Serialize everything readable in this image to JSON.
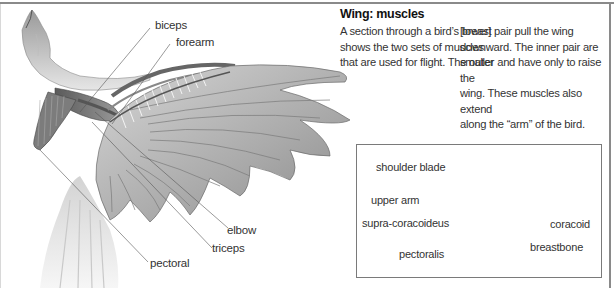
{
  "article": {
    "title": "Wing: muscles",
    "column1": [
      "A section through a bird’s breast",
      "shows the two sets of muscles",
      "that are used for flight. The outer"
    ],
    "column2": [
      "[lower] pair pull the wing",
      "downward. The inner pair are",
      "smaller and have only to raise the",
      "wing. These muscles also extend",
      "along the “arm” of the bird."
    ]
  },
  "main_illustration": {
    "subject": "bird-wing-muscles-illustration",
    "labels": {
      "biceps": "biceps",
      "forearm": "forearm",
      "elbow": "elbow",
      "triceps": "triceps",
      "pectoral": "pectoral"
    }
  },
  "inset_diagram": {
    "subject": "breast-cross-section-diagram",
    "labels": {
      "shoulder_blade": "shoulder blade",
      "upper_arm": "upper arm",
      "supra_coracoideus": "supra-coracoideus",
      "pectoralis": "pectoralis",
      "coracoid": "coracoid",
      "breastbone": "breastbone"
    }
  },
  "colors": {
    "frame": "#8a8a8a",
    "muscle": "#6e6e6e",
    "feather": "#b9b9b9",
    "text": "#333333"
  }
}
